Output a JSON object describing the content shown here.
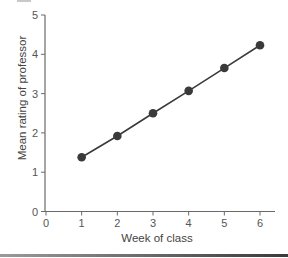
{
  "chart_data": {
    "type": "line",
    "title": "",
    "xlabel": "Week of class",
    "ylabel": "Mean rating of professor",
    "x": [
      1,
      2,
      3,
      4,
      5,
      6
    ],
    "series": [
      {
        "name": "Mean rating",
        "values": [
          1.38,
          1.92,
          2.5,
          3.07,
          3.65,
          4.23
        ]
      }
    ],
    "xlim": [
      0,
      6
    ],
    "ylim": [
      0,
      5
    ],
    "xticks": [
      "0",
      "1",
      "2",
      "3",
      "4",
      "5",
      "6"
    ],
    "yticks": [
      "0",
      "1",
      "2",
      "3",
      "4",
      "5"
    ],
    "grid": false,
    "legend": null,
    "markers": "filled-circle",
    "colors": {
      "line": "#3a3a3a",
      "marker": "#3a3a3a",
      "axis": "#6a6a6a",
      "text": "#555555"
    }
  }
}
